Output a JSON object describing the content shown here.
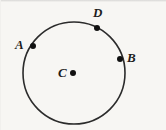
{
  "figure": {
    "kind": "geometry-diagram",
    "background_color": "#f7f6f3",
    "stroke_color": "#2b2b2b",
    "point_color": "#111111",
    "label_color": "#1d1d1d",
    "width": 166,
    "height": 130
  },
  "circle": {
    "center_x": 74,
    "center_y": 73,
    "radius": 51,
    "stroke_width": 1.6
  },
  "center_point": {
    "label": "C",
    "x": 73,
    "y": 73,
    "dot_radius": 3,
    "label_x": 58,
    "label_y": 66
  },
  "points": [
    {
      "label": "A",
      "x": 33,
      "y": 46,
      "dot_radius": 3,
      "label_x": 15,
      "label_y": 38
    },
    {
      "label": "D",
      "x": 97,
      "y": 28,
      "dot_radius": 3,
      "label_x": 93,
      "label_y": 6
    },
    {
      "label": "B",
      "x": 120,
      "y": 59,
      "dot_radius": 3,
      "label_x": 127,
      "label_y": 51
    }
  ]
}
